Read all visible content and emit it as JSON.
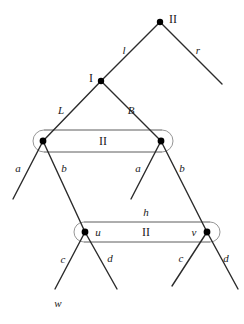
{
  "figure": {
    "width": 244,
    "height": 324,
    "colors": {
      "edge": "#2b2b2b",
      "node": "#000000",
      "capsule_stroke": "#8a8a8a",
      "text": "#1a1a1a",
      "background": "#ffffff"
    }
  },
  "nodes": [
    {
      "id": "root",
      "label": "II",
      "x": 160,
      "y": 22,
      "radius": 3.2
    },
    {
      "id": "I",
      "label": "I",
      "x": 101,
      "y": 81,
      "radius": 3.2
    },
    {
      "id": "p",
      "label": "",
      "x": 43,
      "y": 141,
      "radius": 3.4
    },
    {
      "id": "q",
      "label": "",
      "x": 161,
      "y": 141,
      "radius": 3.4
    },
    {
      "id": "u",
      "label": "u",
      "x": 85,
      "y": 232,
      "radius": 3.4
    },
    {
      "id": "v",
      "label": "v",
      "x": 207,
      "y": 232,
      "radius": 3.4
    }
  ],
  "capsules": [
    {
      "id": "upper-capsule",
      "label": "II",
      "x": 33,
      "y": 130,
      "width": 140,
      "height": 22,
      "label_x": 103,
      "label_y": 141
    },
    {
      "id": "lower-capsule",
      "label": "II",
      "x": 74,
      "y": 222,
      "width": 146,
      "height": 20,
      "label_x": 146,
      "label_y": 232
    }
  ],
  "edges": [
    {
      "id": "root-l",
      "label": "l",
      "x1": 160,
      "y1": 22,
      "x2": 101,
      "y2": 81,
      "label_x": 124,
      "label_y": 50,
      "style": "italic"
    },
    {
      "id": "root-r",
      "label": "r",
      "x1": 160,
      "y1": 22,
      "x2": 222,
      "y2": 84,
      "label_x": 198,
      "label_y": 50,
      "style": "italic"
    },
    {
      "id": "I-L",
      "label": "L",
      "x1": 101,
      "y1": 81,
      "x2": 43,
      "y2": 141,
      "label_x": 61,
      "label_y": 110,
      "style": "italic"
    },
    {
      "id": "I-B",
      "label": "B",
      "x1": 101,
      "y1": 81,
      "x2": 161,
      "y2": 141,
      "label_x": 131,
      "label_y": 110,
      "style": "italic"
    },
    {
      "id": "p-a",
      "label": "a",
      "x1": 43,
      "y1": 141,
      "x2": 13,
      "y2": 199,
      "label_x": 18,
      "label_y": 168,
      "style": "italic"
    },
    {
      "id": "p-b",
      "label": "b",
      "x1": 43,
      "y1": 141,
      "x2": 85,
      "y2": 232,
      "label_x": 64,
      "label_y": 168,
      "style": "italic"
    },
    {
      "id": "q-a",
      "label": "a",
      "x1": 161,
      "y1": 141,
      "x2": 131,
      "y2": 199,
      "label_x": 138,
      "label_y": 168,
      "style": "italic"
    },
    {
      "id": "q-b",
      "label": "b",
      "x1": 161,
      "y1": 141,
      "x2": 207,
      "y2": 232,
      "label_x": 182,
      "label_y": 168,
      "style": "italic"
    },
    {
      "id": "u-c",
      "label": "c",
      "x1": 85,
      "y1": 232,
      "x2": 55,
      "y2": 289,
      "label_x": 63,
      "label_y": 259,
      "style": "italic"
    },
    {
      "id": "u-d",
      "label": "d",
      "x1": 85,
      "y1": 232,
      "x2": 117,
      "y2": 289,
      "label_x": 110,
      "label_y": 258,
      "style": "italic"
    },
    {
      "id": "v-c",
      "label": "c",
      "x1": 207,
      "y1": 232,
      "x2": 172,
      "y2": 286,
      "label_x": 181,
      "label_y": 258,
      "style": "italic"
    },
    {
      "id": "v-d",
      "label": "d",
      "x1": 207,
      "y1": 232,
      "x2": 238,
      "y2": 289,
      "label_x": 226,
      "label_y": 258,
      "style": "italic"
    }
  ],
  "annotations": [
    {
      "id": "node-label-root",
      "text": "II",
      "x": 173,
      "y": 19,
      "style": "roman",
      "size": 12
    },
    {
      "id": "node-label-I",
      "text": "I",
      "x": 91,
      "y": 78,
      "style": "roman",
      "size": 12
    },
    {
      "id": "capsule-label-h",
      "text": "h",
      "x": 146,
      "y": 212,
      "style": "italic",
      "size": 11
    },
    {
      "id": "node-label-u",
      "text": "u",
      "x": 98,
      "y": 232,
      "style": "italic",
      "size": 11
    },
    {
      "id": "node-label-v",
      "text": "v",
      "x": 194,
      "y": 232,
      "style": "italic",
      "size": 11
    },
    {
      "id": "leaf-label-w",
      "text": "w",
      "x": 58,
      "y": 303,
      "style": "italic",
      "size": 11
    }
  ]
}
